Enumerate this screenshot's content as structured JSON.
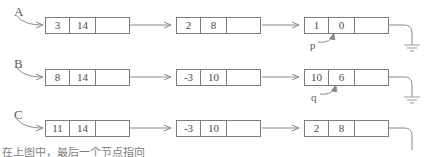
{
  "diagram": {
    "title_hidden_bottom_text": "在上图中，最后一个节点指向",
    "stroke_color": "#7c7c7c",
    "text_color": "#4a4a4a",
    "label_color": "#5a5a5a",
    "background": "#ffffff",
    "rows": [
      {
        "label": "A",
        "nodes": [
          {
            "cells": [
              "3",
              "14",
              ""
            ]
          },
          {
            "cells": [
              "2",
              "8",
              ""
            ]
          },
          {
            "cells": [
              "1",
              "0",
              ""
            ]
          }
        ],
        "pointer_label": "p",
        "terminator": "ground-symbol"
      },
      {
        "label": "B",
        "nodes": [
          {
            "cells": [
              "8",
              "14",
              ""
            ]
          },
          {
            "cells": [
              "-3",
              "10",
              ""
            ]
          },
          {
            "cells": [
              "10",
              "6",
              ""
            ]
          }
        ],
        "pointer_label": "q",
        "terminator": "ground-symbol"
      },
      {
        "label": "C",
        "nodes": [
          {
            "cells": [
              "11",
              "14",
              ""
            ]
          },
          {
            "cells": [
              "-3",
              "10",
              ""
            ]
          },
          {
            "cells": [
              "2",
              "8",
              ""
            ]
          }
        ],
        "pointer_label": "",
        "terminator": "ground-symbol"
      }
    ]
  }
}
